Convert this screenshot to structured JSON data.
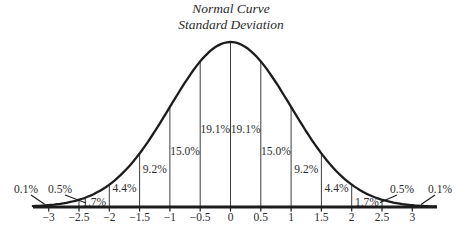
{
  "chart_data": {
    "type": "area",
    "title": "Normal Curve",
    "subtitle": "Standard Deviation",
    "xlabel": "",
    "ylabel": "",
    "x_range": [
      -3,
      3
    ],
    "grid": false,
    "colors": {
      "line": "#1c1c1c",
      "text": "#2b2b2b",
      "divider": "#3d3d3d"
    },
    "x_axis": {
      "ticks": [
        {
          "v": -3,
          "label": "−3"
        },
        {
          "v": -2.5,
          "label": "−2.5"
        },
        {
          "v": -2,
          "label": "−2"
        },
        {
          "v": -1.5,
          "label": "−1.5"
        },
        {
          "v": -1,
          "label": "−1"
        },
        {
          "v": -0.5,
          "label": "−0.5"
        },
        {
          "v": 0,
          "label": "0"
        },
        {
          "v": 0.5,
          "label": "0.5"
        },
        {
          "v": 1,
          "label": "1"
        },
        {
          "v": 1.5,
          "label": "1.5"
        },
        {
          "v": 2,
          "label": "2"
        },
        {
          "v": 2.5,
          "label": "2.5"
        },
        {
          "v": 3,
          "label": "3"
        }
      ]
    },
    "divider_lines": [
      -2.5,
      -2,
      -1.5,
      -1,
      -0.5,
      0,
      0.5,
      1,
      1.5,
      2,
      2.5
    ],
    "segments": [
      {
        "from": -2.5,
        "to": -2,
        "percent": 1.7,
        "label": "1.7%",
        "label_y": 205.5
      },
      {
        "from": -2,
        "to": -1.5,
        "percent": 4.4,
        "label": "4.4%",
        "label_y": 191.5
      },
      {
        "from": -1.5,
        "to": -1,
        "percent": 9.2,
        "label": "9.2%",
        "label_y": 173
      },
      {
        "from": -1,
        "to": -0.5,
        "percent": 15.0,
        "label": "15.0%",
        "label_y": 155
      },
      {
        "from": -0.5,
        "to": 0,
        "percent": 19.1,
        "label": "19.1%",
        "label_y": 133
      },
      {
        "from": 0,
        "to": 0.5,
        "percent": 19.1,
        "label": "19.1%",
        "label_y": 133
      },
      {
        "from": 0.5,
        "to": 1,
        "percent": 15.0,
        "label": "15.0%",
        "label_y": 155
      },
      {
        "from": 1,
        "to": 1.5,
        "percent": 9.2,
        "label": "9.2%",
        "label_y": 173
      },
      {
        "from": 1.5,
        "to": 2,
        "percent": 4.4,
        "label": "4.4%",
        "label_y": 191.5
      },
      {
        "from": 2,
        "to": 2.5,
        "percent": 1.7,
        "label": "1.7%",
        "label_y": 205.5
      }
    ],
    "callouts": [
      {
        "region": "below −3",
        "percent": 0.1,
        "label": "0.1%",
        "label_x": 26,
        "label_y": 193,
        "leader": [
          31,
          195,
          45,
          204.5
        ]
      },
      {
        "region": "−3 to −2.5",
        "percent": 0.5,
        "label": "0.5%",
        "label_x": 60,
        "label_y": 193,
        "leader": [
          65,
          195,
          86,
          203
        ]
      },
      {
        "region": "2.5 to 3",
        "percent": 0.5,
        "label": "0.5%",
        "label_x": 402,
        "label_y": 193,
        "leader": [
          397,
          195,
          380,
          202.5
        ]
      },
      {
        "region": "above 3",
        "percent": 0.1,
        "label": "0.1%",
        "label_x": 440,
        "label_y": 193,
        "leader": [
          435,
          195,
          421,
          204.5
        ]
      }
    ]
  }
}
